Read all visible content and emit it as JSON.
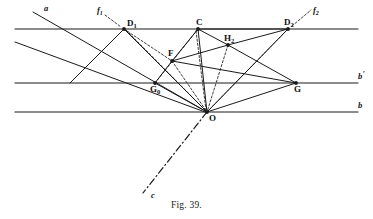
{
  "figure": {
    "caption": "Fig. 39.",
    "caption_y": 200,
    "width": 373,
    "height": 219,
    "stroke_color": "#1a1a1a",
    "background_color": "#ffffff"
  },
  "chart_data": {
    "type": "diagram",
    "title": "Fig. 39.",
    "xlabel": "",
    "ylabel": "",
    "xlim": [
      0,
      373
    ],
    "ylim": [
      0,
      219
    ],
    "grid": false,
    "legend": "none",
    "points": [
      {
        "id": "D1",
        "label": "D",
        "sub": "1",
        "x": 124,
        "y": 29,
        "label_dx": 3,
        "label_dy": -3,
        "marker": true
      },
      {
        "id": "C",
        "label": "C",
        "sub": "",
        "x": 198,
        "y": 29,
        "label_dx": -2,
        "label_dy": -4,
        "marker": true
      },
      {
        "id": "D2",
        "label": "D",
        "sub": "2",
        "x": 288,
        "y": 29,
        "label_dx": -4,
        "label_dy": -4,
        "marker": true
      },
      {
        "id": "H2",
        "label": "H",
        "sub": "2",
        "x": 228,
        "y": 45,
        "label_dx": -4,
        "label_dy": -4,
        "marker": true
      },
      {
        "id": "F",
        "label": "F",
        "sub": "",
        "x": 172,
        "y": 61,
        "label_dx": -4,
        "label_dy": -5,
        "marker": true
      },
      {
        "id": "G0",
        "label": "G",
        "sub": "0",
        "x": 155,
        "y": 83,
        "label_dx": -5,
        "label_dy": 9,
        "marker": true
      },
      {
        "id": "G",
        "label": "G",
        "sub": "",
        "x": 296,
        "y": 83,
        "label_dx": -2,
        "label_dy": 9,
        "marker": true
      },
      {
        "id": "O",
        "label": "O",
        "sub": "",
        "x": 207,
        "y": 112,
        "label_dx": 2,
        "label_dy": 9,
        "marker": true
      }
    ],
    "horizontal_lines": [
      {
        "id": "line-top",
        "y": 29,
        "x1": 15,
        "x2": 358,
        "label": "",
        "sub": ""
      },
      {
        "id": "line-bprime",
        "y": 83,
        "x1": 15,
        "x2": 358,
        "label": "b",
        "sub": "'",
        "label_x": 362,
        "label_y": 79
      },
      {
        "id": "line-b",
        "y": 112,
        "x1": 15,
        "x2": 358,
        "label": "b",
        "sub": "",
        "label_x": 362,
        "label_y": 108
      }
    ],
    "solid_segments": [
      {
        "id": "line-a",
        "x1": 33,
        "y1": 12,
        "x2": 207,
        "y2": 112
      },
      {
        "id": "line-a-par",
        "x1": 15,
        "y1": 42,
        "x2": 205,
        "y2": 112
      },
      {
        "id": "D1-O",
        "x1": 124,
        "y1": 29,
        "x2": 207,
        "y2": 112
      },
      {
        "id": "C-F",
        "x1": 198,
        "y1": 29,
        "x2": 172,
        "y2": 61
      },
      {
        "id": "C-O",
        "x1": 198,
        "y1": 29,
        "x2": 207,
        "y2": 112
      },
      {
        "id": "C-H2",
        "x1": 198,
        "y1": 29,
        "x2": 228,
        "y2": 45
      },
      {
        "id": "C-D2",
        "x1": 198,
        "y1": 29,
        "x2": 288,
        "y2": 29
      },
      {
        "id": "H2-D2",
        "x1": 228,
        "y1": 45,
        "x2": 288,
        "y2": 29
      },
      {
        "id": "F-H2",
        "x1": 172,
        "y1": 61,
        "x2": 228,
        "y2": 45
      },
      {
        "id": "H2-G",
        "x1": 228,
        "y1": 45,
        "x2": 296,
        "y2": 83
      },
      {
        "id": "F-G0",
        "x1": 172,
        "y1": 61,
        "x2": 155,
        "y2": 83
      },
      {
        "id": "F-G",
        "x1": 172,
        "y1": 61,
        "x2": 296,
        "y2": 83
      },
      {
        "id": "G0-O",
        "x1": 155,
        "y1": 83,
        "x2": 207,
        "y2": 112
      },
      {
        "id": "G-O",
        "x1": 296,
        "y1": 83,
        "x2": 207,
        "y2": 112
      },
      {
        "id": "D2-O",
        "x1": 288,
        "y1": 29,
        "x2": 207,
        "y2": 112
      },
      {
        "id": "D1-G0-ext",
        "x1": 124,
        "y1": 29,
        "x2": 70,
        "y2": 83
      }
    ],
    "dashed_segments": [
      {
        "id": "f1-tick",
        "x1": 105,
        "y1": 15,
        "x2": 121,
        "y2": 27
      },
      {
        "id": "f2-tick",
        "x1": 292,
        "y1": 26,
        "x2": 311,
        "y2": 10
      },
      {
        "id": "D1-O-d",
        "x1": 126,
        "y1": 30,
        "x2": 207,
        "y2": 112
      },
      {
        "id": "D1-F-d",
        "x1": 124,
        "y1": 29,
        "x2": 172,
        "y2": 61
      },
      {
        "id": "F-O-d",
        "x1": 172,
        "y1": 61,
        "x2": 207,
        "y2": 112
      },
      {
        "id": "G0-Cd",
        "x1": 155,
        "y1": 83,
        "x2": 198,
        "y2": 29
      },
      {
        "id": "H2-O-d",
        "x1": 228,
        "y1": 45,
        "x2": 207,
        "y2": 112
      },
      {
        "id": "D2-O-d2",
        "x1": 286,
        "y1": 31,
        "x2": 207,
        "y2": 112
      },
      {
        "id": "C-O-d",
        "x1": 196,
        "y1": 31,
        "x2": 206,
        "y2": 110
      }
    ],
    "dashdot_segments": [
      {
        "id": "line-c",
        "x1": 207,
        "y1": 112,
        "x2": 143,
        "y2": 193
      }
    ],
    "line_labels": [
      {
        "id": "label-a",
        "text": "a",
        "sub": "",
        "x": 44,
        "y": 11
      },
      {
        "id": "label-f1",
        "text": "f",
        "sub": "1",
        "x": 97,
        "y": 13
      },
      {
        "id": "label-f2",
        "text": "f",
        "sub": "2",
        "x": 313,
        "y": 13
      },
      {
        "id": "label-c",
        "text": "c",
        "sub": "",
        "x": 151,
        "y": 198
      },
      {
        "id": "label-bprime",
        "text": "b",
        "sub": "'",
        "x": 358,
        "y": 79
      },
      {
        "id": "label-b",
        "text": "b",
        "sub": "",
        "x": 358,
        "y": 108
      }
    ]
  }
}
